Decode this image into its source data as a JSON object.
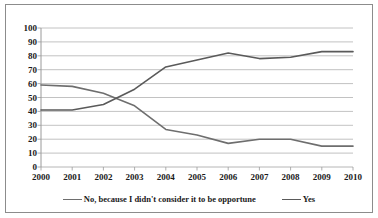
{
  "chart_data": {
    "type": "line",
    "title": "",
    "xlabel": "",
    "ylabel": "",
    "ylim": [
      0,
      100
    ],
    "ytick_step": 10,
    "grid": true,
    "legend_position": "bottom",
    "categories": [
      "2000",
      "2001",
      "2002",
      "2003",
      "2004",
      "2005",
      "2006",
      "2007",
      "2008",
      "2009",
      "2010"
    ],
    "yticks": [
      "100",
      "90",
      "80",
      "70",
      "60",
      "50",
      "40",
      "30",
      "20",
      "10",
      "0"
    ],
    "series": [
      {
        "name": "No, because I didn't consider it to be opportune",
        "color": "#6e6e6e",
        "values": [
          59,
          58,
          53,
          44,
          27,
          23,
          17,
          20,
          20,
          15,
          15
        ]
      },
      {
        "name": "Yes",
        "color": "#5a5a5a",
        "values": [
          41,
          41,
          45,
          56,
          72,
          77,
          82,
          78,
          79,
          83,
          83
        ]
      }
    ]
  },
  "style": {
    "grid_color": "#aeaeae",
    "axis_color": "#9a9a9a",
    "border_color": "#8c8c8c",
    "text_color": "#1a1a1a",
    "background": "#ffffff"
  }
}
